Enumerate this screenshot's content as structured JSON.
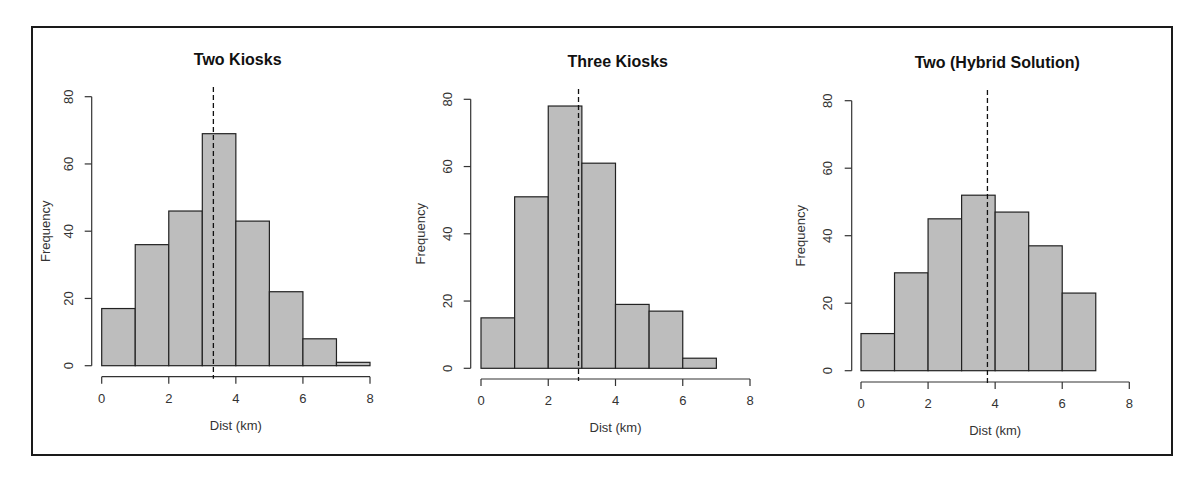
{
  "figure": {
    "frame": {
      "x": 32,
      "y": 27,
      "width": 1140,
      "height": 428
    },
    "bar_fill": "#bdbdbd",
    "bar_stroke": "#222222"
  },
  "chart_data": [
    {
      "type": "bar",
      "subtype": "histogram",
      "title": "Two Kiosks",
      "xlabel": "Dist (km)",
      "ylabel": "Frequency",
      "bin_edges": [
        0,
        1,
        2,
        3,
        4,
        5,
        6,
        7,
        8
      ],
      "values": [
        17,
        36,
        46,
        69,
        43,
        22,
        8,
        1
      ],
      "xticks": [
        0,
        2,
        4,
        6,
        8
      ],
      "yticks": [
        0,
        20,
        40,
        60,
        80
      ],
      "xlim": [
        0,
        8
      ],
      "ylim": [
        0,
        80
      ],
      "mean_line": 3.33,
      "grid": false,
      "layout": {
        "x0": 101.7,
        "x1": 370,
        "y0": 365.7,
        "y80": 96.7,
        "yaxis_x": 91.7,
        "xaxis_y": 376.7,
        "title_x": 237.7,
        "title_y": 65,
        "ylabel_x": 45,
        "ytick_x": 69,
        "meanline_top": 87
      }
    },
    {
      "type": "bar",
      "subtype": "histogram",
      "title": "Three Kiosks",
      "xlabel": "Dist (km)",
      "ylabel": "Frequency",
      "bin_edges": [
        0,
        1,
        2,
        3,
        4,
        5,
        6,
        7
      ],
      "values": [
        15,
        51,
        78,
        61,
        19,
        17,
        3
      ],
      "xticks": [
        0,
        2,
        4,
        6,
        8
      ],
      "yticks": [
        0,
        20,
        40,
        60,
        80
      ],
      "xlim": [
        0,
        8
      ],
      "ylim": [
        0,
        80
      ],
      "mean_line": 2.9,
      "grid": false,
      "layout": {
        "x0": 481,
        "x1": 750,
        "y0": 368.3,
        "y80": 99.3,
        "yaxis_x": 470.7,
        "xaxis_y": 379,
        "title_x": 617.7,
        "title_y": 67,
        "ylabel_x": 420,
        "ytick_x": 448,
        "meanline_top": 89
      }
    },
    {
      "type": "bar",
      "subtype": "histogram",
      "title": "Two (Hybrid Solution)",
      "xlabel": "Dist (km)",
      "ylabel": "Frequency",
      "bin_edges": [
        0,
        1,
        2,
        3,
        4,
        5,
        6,
        7
      ],
      "values": [
        11,
        29,
        45,
        52,
        47,
        37,
        23
      ],
      "xticks": [
        0,
        2,
        4,
        6,
        8
      ],
      "yticks": [
        0,
        20,
        40,
        60,
        80
      ],
      "xlim": [
        0,
        8
      ],
      "ylim": [
        0,
        80
      ],
      "mean_line": 3.77,
      "grid": false,
      "layout": {
        "x0": 861,
        "x1": 1129.3,
        "y0": 370.7,
        "y80": 100.7,
        "yaxis_x": 851.7,
        "xaxis_y": 382,
        "title_x": 997.3,
        "title_y": 68,
        "ylabel_x": 800,
        "ytick_x": 828,
        "meanline_top": 90
      }
    }
  ]
}
